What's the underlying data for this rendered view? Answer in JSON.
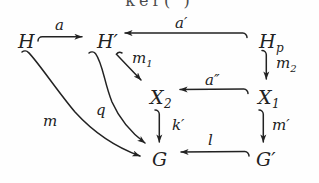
{
  "figure": {
    "kind": "commutative-diagram",
    "background_color": "#fefefe",
    "ink_color": "#222222",
    "cropped_text_above": "ker( )"
  },
  "nodes": [
    {
      "id": "H",
      "label": "H",
      "base": "H",
      "sub": "",
      "prime": "",
      "x": 18,
      "y": 32
    },
    {
      "id": "Hp",
      "label": "H'",
      "base": "H",
      "sub": "",
      "prime": "′",
      "x": 97,
      "y": 32
    },
    {
      "id": "Hsubp",
      "label": "Hp",
      "base": "H",
      "sub": "p",
      "prime": "",
      "x": 259,
      "y": 32
    },
    {
      "id": "X2",
      "label": "X2",
      "base": "X",
      "sub": "2",
      "prime": "",
      "x": 150,
      "y": 88
    },
    {
      "id": "X1",
      "label": "X1",
      "base": "X",
      "sub": "1",
      "prime": "",
      "x": 258,
      "y": 88
    },
    {
      "id": "G",
      "label": "G",
      "base": "G",
      "sub": "",
      "prime": "",
      "x": 152,
      "y": 150
    },
    {
      "id": "Gp",
      "label": "G'",
      "base": "G",
      "sub": "",
      "prime": "′",
      "x": 256,
      "y": 150
    }
  ],
  "edges": [
    {
      "id": "a",
      "label": "a",
      "base": "a",
      "sub": "",
      "primes": "",
      "from": "H",
      "to": "Hp",
      "style": "hooked-arrow",
      "direction": "right",
      "label_x": 55,
      "label_y": 18
    },
    {
      "id": "ap",
      "label": "a'",
      "base": "a",
      "sub": "",
      "primes": "′",
      "from": "Hsubp",
      "to": "Hp",
      "style": "hooked-arrow",
      "direction": "left",
      "label_x": 175,
      "label_y": 16
    },
    {
      "id": "m1",
      "label": "m1",
      "base": "m",
      "sub": "1",
      "primes": "",
      "from": "Hp",
      "to": "X2",
      "style": "hooked-arrow",
      "direction": "down-right",
      "label_x": 132,
      "label_y": 51
    },
    {
      "id": "m2",
      "label": "m2",
      "base": "m",
      "sub": "2",
      "primes": "",
      "from": "Hsubp",
      "to": "X1",
      "style": "hooked-arrow",
      "direction": "down",
      "label_x": 276,
      "label_y": 56
    },
    {
      "id": "app",
      "label": "a''",
      "base": "a",
      "sub": "",
      "primes": "″",
      "from": "X1",
      "to": "X2",
      "style": "hooked-arrow",
      "direction": "left",
      "label_x": 205,
      "label_y": 73
    },
    {
      "id": "kp",
      "label": "k'",
      "base": "k",
      "sub": "",
      "primes": "′",
      "from": "X2",
      "to": "G",
      "style": "hooked-arrow",
      "direction": "down",
      "label_x": 172,
      "label_y": 118
    },
    {
      "id": "mp",
      "label": "m'",
      "base": "m",
      "sub": "",
      "primes": "′",
      "from": "X1",
      "to": "Gp",
      "style": "hooked-arrow",
      "direction": "down",
      "label_x": 272,
      "label_y": 118
    },
    {
      "id": "l",
      "label": "l",
      "base": "l",
      "sub": "",
      "primes": "",
      "from": "Gp",
      "to": "G",
      "style": "hooked-arrow",
      "direction": "left",
      "label_x": 208,
      "label_y": 133
    },
    {
      "id": "m",
      "label": "m",
      "base": "m",
      "sub": "",
      "primes": "",
      "from": "H",
      "to": "G",
      "style": "hooked-curve",
      "direction": "curve-down-right",
      "label_x": 43,
      "label_y": 114
    },
    {
      "id": "q",
      "label": "q",
      "base": "q",
      "sub": "",
      "primes": "",
      "from": "Hp",
      "to": "G",
      "style": "hooked-curve",
      "direction": "curve-down-right",
      "label_x": 96,
      "label_y": 103
    }
  ]
}
